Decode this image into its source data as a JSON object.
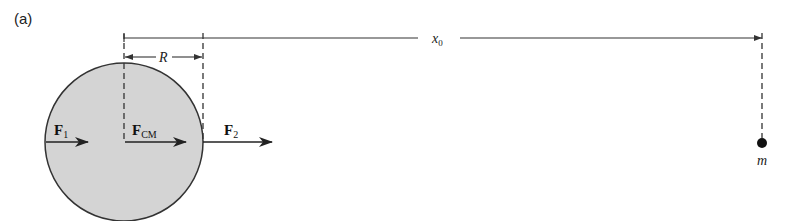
{
  "figure": {
    "panel_label": "(a)",
    "dimension_x0": {
      "symbol": "x",
      "subscript": "0"
    },
    "dimension_R": {
      "symbol": "R"
    },
    "forces": [
      {
        "id": "F1",
        "symbol": "F",
        "subscript": "1"
      },
      {
        "id": "FCM",
        "symbol": "F",
        "subscript": "CM"
      },
      {
        "id": "F2",
        "symbol": "F",
        "subscript": "2"
      }
    ],
    "point_mass": {
      "label": "m"
    },
    "colors": {
      "sphere_fill": "#d4d4d4",
      "stroke": "#333333",
      "mass_fill": "#111111"
    }
  }
}
